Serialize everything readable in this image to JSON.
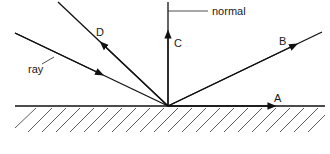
{
  "diagram": {
    "labels": {
      "normal": "normal",
      "ray": "ray",
      "A": "A",
      "B": "B",
      "C": "C",
      "D": "D"
    },
    "colors": {
      "line": "#111111",
      "background": "#ffffff"
    }
  }
}
